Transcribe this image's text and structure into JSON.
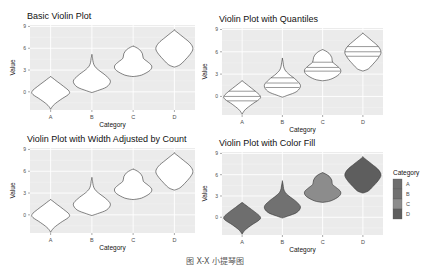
{
  "figure_caption": "图 X-X 小提琴图",
  "colors": {
    "panel_bg": "#ebebeb",
    "grid_major": "#ffffff",
    "grid_minor": "#f4f4f4",
    "outline": "#333333",
    "tick_text": "#4d4d4d",
    "fill_A": "#6e6e6e",
    "fill_B": "#717171",
    "fill_C": "#8c8c8c",
    "fill_D": "#5e5e5e"
  },
  "legend": {
    "title": "Category",
    "items": [
      {
        "label": "A",
        "color": "#6e6e6e"
      },
      {
        "label": "B",
        "color": "#717171"
      },
      {
        "label": "C",
        "color": "#8c8c8c"
      },
      {
        "label": "D",
        "color": "#5e5e5e"
      }
    ]
  },
  "chart_data": [
    {
      "type": "violin",
      "title": "Basic Violin Plot",
      "xlabel": "Category",
      "ylabel": "Value",
      "categories": [
        "A",
        "B",
        "C",
        "D"
      ],
      "yticks": [
        0,
        3,
        6,
        9
      ],
      "ylim": [
        -2.5,
        9.2
      ],
      "violins": [
        {
          "category": "A",
          "min": -2.4,
          "max": 2.1,
          "widest": 0.0,
          "upper_bulge": 0.0
        },
        {
          "category": "B",
          "min": -0.1,
          "max": 5.1,
          "widest": 1.7,
          "spike": 4.0
        },
        {
          "category": "C",
          "min": 2.1,
          "max": 6.3,
          "widest": 3.8,
          "shoulder": 5.3
        },
        {
          "category": "D",
          "min": 3.4,
          "max": 8.5,
          "widest": 6.0
        }
      ],
      "quantiles_shown": false,
      "fill": "white",
      "legend": false
    },
    {
      "type": "violin",
      "title": "Violin Plot with Quantiles",
      "xlabel": "Category",
      "ylabel": "Value",
      "categories": [
        "A",
        "B",
        "C",
        "D"
      ],
      "yticks": [
        0,
        3,
        6,
        9
      ],
      "ylim": [
        -2.5,
        9.2
      ],
      "violins": [
        {
          "category": "A",
          "min": -2.4,
          "max": 2.1,
          "quantiles": [
            -0.6,
            0.0,
            0.7
          ]
        },
        {
          "category": "B",
          "min": -0.1,
          "max": 5.1,
          "quantiles": [
            1.2,
            1.8,
            2.5
          ]
        },
        {
          "category": "C",
          "min": 2.1,
          "max": 6.3,
          "quantiles": [
            3.4,
            3.9,
            4.6
          ]
        },
        {
          "category": "D",
          "min": 3.4,
          "max": 8.5,
          "quantiles": [
            5.4,
            6.0,
            6.7
          ]
        }
      ],
      "quantiles_shown": true,
      "quantile_levels": [
        0.25,
        0.5,
        0.75
      ],
      "fill": "white",
      "legend": false
    },
    {
      "type": "violin",
      "title": "Violin Plot with Width Adjusted by Count",
      "xlabel": "Category",
      "ylabel": "Value",
      "categories": [
        "A",
        "B",
        "C",
        "D"
      ],
      "yticks": [
        0,
        3,
        6,
        9
      ],
      "ylim": [
        -2.5,
        9.2
      ],
      "violins": [
        {
          "category": "A",
          "min": -2.4,
          "max": 2.1
        },
        {
          "category": "B",
          "min": -0.1,
          "max": 5.1
        },
        {
          "category": "C",
          "min": 2.1,
          "max": 6.3
        },
        {
          "category": "D",
          "min": 3.4,
          "max": 8.5
        }
      ],
      "scale": "count",
      "fill": "white",
      "legend": false
    },
    {
      "type": "violin",
      "title": "Violin Plot with Color Fill",
      "xlabel": "Category",
      "ylabel": "Value",
      "categories": [
        "A",
        "B",
        "C",
        "D"
      ],
      "yticks": [
        0,
        3,
        6,
        9
      ],
      "ylim": [
        -2.5,
        9.2
      ],
      "violins": [
        {
          "category": "A",
          "min": -2.4,
          "max": 2.1,
          "fill": "#6e6e6e"
        },
        {
          "category": "B",
          "min": -0.1,
          "max": 5.1,
          "fill": "#717171"
        },
        {
          "category": "C",
          "min": 2.1,
          "max": 6.3,
          "fill": "#8c8c8c"
        },
        {
          "category": "D",
          "min": 3.4,
          "max": 8.5,
          "fill": "#5e5e5e"
        }
      ],
      "fill": "by category",
      "legend": true,
      "legend_title": "Category"
    }
  ]
}
